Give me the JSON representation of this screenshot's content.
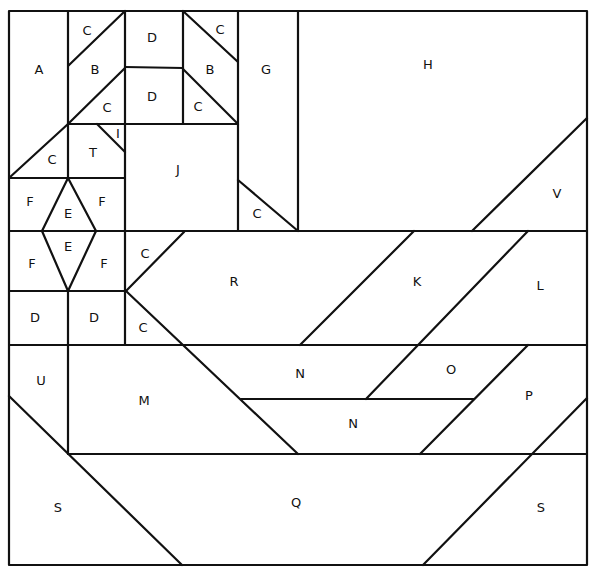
{
  "diagram": {
    "colors": {
      "line": "#111111",
      "background": "#ffffff"
    },
    "border": {
      "x1": 9,
      "y1": 11,
      "x2": 587,
      "y2": 565
    },
    "lines": [
      [
        68,
        11,
        68,
        178
      ],
      [
        125,
        11,
        125,
        345
      ],
      [
        183,
        11,
        183,
        124
      ],
      [
        238,
        11,
        238,
        231
      ],
      [
        298,
        11,
        298,
        231
      ],
      [
        125,
        67,
        183,
        68
      ],
      [
        68,
        124,
        238,
        124
      ],
      [
        9,
        178,
        125,
        178
      ],
      [
        9,
        231,
        587,
        231
      ],
      [
        9,
        291,
        126,
        291
      ],
      [
        9,
        345,
        587,
        345
      ],
      [
        241,
        399,
        474,
        399
      ],
      [
        68,
        454,
        587,
        454
      ],
      [
        68,
        291,
        68,
        454
      ],
      [
        125,
        11,
        68,
        66
      ],
      [
        125,
        68,
        68,
        124
      ],
      [
        183,
        11,
        238,
        62
      ],
      [
        183,
        69,
        238,
        124
      ],
      [
        97,
        124,
        125,
        152
      ],
      [
        68,
        124,
        9,
        178
      ],
      [
        238,
        180,
        298,
        231
      ],
      [
        68,
        178,
        42,
        231
      ],
      [
        68,
        178,
        96,
        231
      ],
      [
        42,
        231,
        68,
        291
      ],
      [
        96,
        231,
        68,
        291
      ],
      [
        126,
        291,
        184,
        232
      ],
      [
        126,
        291,
        298,
        454
      ],
      [
        587,
        118,
        472,
        231
      ],
      [
        414,
        231,
        300,
        345
      ],
      [
        528,
        231,
        366,
        399
      ],
      [
        528,
        345,
        420,
        454
      ],
      [
        587,
        398,
        423,
        565
      ],
      [
        9,
        396,
        182,
        565
      ]
    ],
    "labels": [
      {
        "text": "A",
        "x": 39,
        "y": 70
      },
      {
        "text": "C",
        "x": 87,
        "y": 31
      },
      {
        "text": "B",
        "x": 95,
        "y": 70
      },
      {
        "text": "C",
        "x": 107,
        "y": 108
      },
      {
        "text": "D",
        "x": 152,
        "y": 38
      },
      {
        "text": "D",
        "x": 152,
        "y": 97
      },
      {
        "text": "C",
        "x": 220,
        "y": 30
      },
      {
        "text": "B",
        "x": 210,
        "y": 70
      },
      {
        "text": "C",
        "x": 198,
        "y": 107
      },
      {
        "text": "G",
        "x": 266,
        "y": 70
      },
      {
        "text": "H",
        "x": 428,
        "y": 65
      },
      {
        "text": "I",
        "x": 118,
        "y": 134
      },
      {
        "text": "T",
        "x": 93,
        "y": 153
      },
      {
        "text": "C",
        "x": 52,
        "y": 160
      },
      {
        "text": "J",
        "x": 178,
        "y": 170
      },
      {
        "text": "C",
        "x": 257,
        "y": 214
      },
      {
        "text": "V",
        "x": 557,
        "y": 194
      },
      {
        "text": "F",
        "x": 30,
        "y": 202
      },
      {
        "text": "E",
        "x": 68,
        "y": 214
      },
      {
        "text": "F",
        "x": 102,
        "y": 202
      },
      {
        "text": "F",
        "x": 32,
        "y": 264
      },
      {
        "text": "E",
        "x": 68,
        "y": 247
      },
      {
        "text": "F",
        "x": 104,
        "y": 264
      },
      {
        "text": "C",
        "x": 145,
        "y": 254
      },
      {
        "text": "R",
        "x": 234,
        "y": 282
      },
      {
        "text": "K",
        "x": 417,
        "y": 282
      },
      {
        "text": "L",
        "x": 540,
        "y": 286
      },
      {
        "text": "D",
        "x": 35,
        "y": 318
      },
      {
        "text": "D",
        "x": 94,
        "y": 318
      },
      {
        "text": "C",
        "x": 143,
        "y": 328
      },
      {
        "text": "U",
        "x": 41,
        "y": 381
      },
      {
        "text": "M",
        "x": 144,
        "y": 401
      },
      {
        "text": "N",
        "x": 300,
        "y": 374
      },
      {
        "text": "O",
        "x": 451,
        "y": 370
      },
      {
        "text": "P",
        "x": 529,
        "y": 396
      },
      {
        "text": "N",
        "x": 353,
        "y": 424
      },
      {
        "text": "S",
        "x": 58,
        "y": 508
      },
      {
        "text": "Q",
        "x": 296,
        "y": 503
      },
      {
        "text": "S",
        "x": 541,
        "y": 508
      }
    ]
  }
}
